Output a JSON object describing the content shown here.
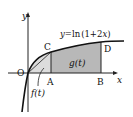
{
  "diagram": {
    "curve_label": "y=ln(1+2x)",
    "curve_label_parts": {
      "y": "y",
      "eq": "=ln",
      "open": "(1+2",
      "x": "x",
      "close": ")"
    },
    "axis_x_label": "x",
    "axis_y_label": "y",
    "origin_label": "O",
    "points": {
      "A": "A",
      "B": "B",
      "C": "C",
      "D": "D"
    },
    "region_labels": {
      "f": "f(t)",
      "g": "g(t)"
    },
    "colors": {
      "shade": "#b8b8b8",
      "curve": "#111111",
      "axis": "#222222"
    }
  }
}
